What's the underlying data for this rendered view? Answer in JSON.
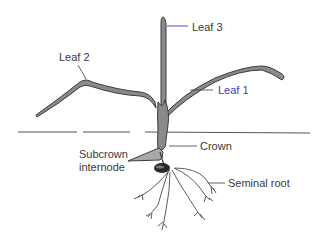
{
  "diagram": {
    "labels": {
      "leaf1": "Leaf 1",
      "leaf2": "Leaf 2",
      "leaf3": "Leaf 3",
      "crown": "Crown",
      "subcrown_line1": "Subcrown",
      "subcrown_line2": "internode",
      "seminal_root": "Seminal root"
    },
    "colors": {
      "leaf_fill": "#8a8a8a",
      "leaf_stroke": "#3c3c3c",
      "subcrown_fill": "#a9a9a9",
      "seed_fill": "#2a2a2a",
      "root_stroke": "#333333",
      "ground_line": "#555555",
      "leaf3_leader": "#3b3bc0",
      "text": "#3a3a3a"
    }
  }
}
